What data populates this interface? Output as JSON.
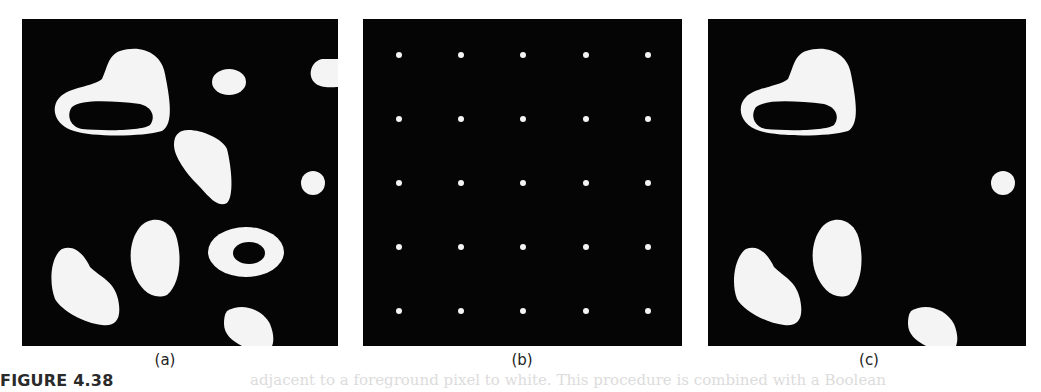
{
  "figure": {
    "label": "FIGURE 4.38",
    "panels": [
      {
        "id": "a",
        "caption": "(a)",
        "description": "Binary image with white blobs on black background (including two ring-shaped objects)"
      },
      {
        "id": "b",
        "caption": "(b)",
        "description": "Marker image: 5x5 grid of white seed points on black background"
      },
      {
        "id": "c",
        "caption": "(c)",
        "description": "Result: only blobs intersecting marker points retained"
      }
    ],
    "marker_grid": {
      "rows": 5,
      "cols": 5
    },
    "colors": {
      "background": "#050505",
      "foreground": "#f4f4f4",
      "page": "#ffffff"
    }
  },
  "bleed_text": "adjacent to a foreground pixel to white. This procedure is combined with a Boolean"
}
